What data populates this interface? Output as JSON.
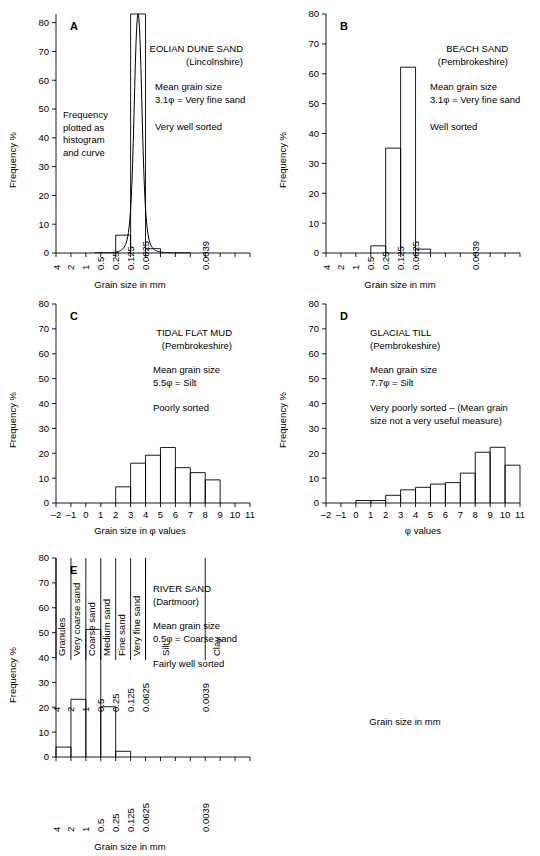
{
  "figure": {
    "axis_titles": {
      "y": "Frequency %",
      "x_mm": "Grain size in mm",
      "x_phi": "Grain size in φ values",
      "x_phi_short": "φ values"
    },
    "y_ticks": [
      0,
      10,
      20,
      30,
      40,
      50,
      60,
      70,
      80
    ],
    "mm_tick_labels": [
      "4",
      "2",
      "1",
      "0.5",
      "0.25",
      "0.125",
      "0.0625",
      "0.0039"
    ],
    "phi_tick_labels": [
      "–2",
      "–1",
      "0",
      "1",
      "2",
      "3",
      "4",
      "5",
      "6",
      "7",
      "8",
      "9",
      "10",
      "11"
    ]
  },
  "panels": [
    {
      "letter": "A",
      "title": "EOLIAN DUNE SAND",
      "locality": "(Lincolnshire)",
      "mean_label": "Mean grain size",
      "mean_value": "3.1φ = Very fine sand",
      "sorting": "Very well sorted",
      "note": "Frequency\nplotted as\nhistogram\nand curve",
      "x_axis_type": "mm"
    },
    {
      "letter": "B",
      "title": "BEACH SAND",
      "locality": "(Pembrokeshire)",
      "mean_label": "Mean grain size",
      "mean_value": "3.1φ = Very fine sand",
      "sorting": "Well sorted",
      "note": "",
      "x_axis_type": "mm"
    },
    {
      "letter": "C",
      "title": "TIDAL FLAT MUD",
      "locality": "(Pembrokeshire)",
      "mean_label": "Mean grain size",
      "mean_value": "5.5φ = Silt",
      "sorting": "Poorly sorted",
      "note": "",
      "x_axis_type": "phi"
    },
    {
      "letter": "D",
      "title": "GLACIAL TILL",
      "locality": "(Pembrokeshire)",
      "mean_label": "Mean grain size",
      "mean_value": "7.7φ = Silt",
      "sorting": "Very poorly sorted – (Mean grain",
      "sorting2": "size not a very useful measure)",
      "note": "",
      "x_axis_type": "phi"
    },
    {
      "letter": "E",
      "title": "RIVER SAND",
      "locality": "(Dartmoor)",
      "mean_label": "Mean grain size",
      "mean_value": "0.5φ = Coarse sand",
      "sorting": "Fairly well sorted",
      "note": "",
      "x_axis_type": "mm"
    }
  ],
  "classification": {
    "x_title": "Grain size in mm",
    "phi_title": "φ values",
    "classes": [
      {
        "name": "Granules",
        "phi_from": -2,
        "phi_to": -1
      },
      {
        "name": "Very coarse sand",
        "phi_from": -1,
        "phi_to": 0
      },
      {
        "name": "Coarse sand",
        "phi_from": 0,
        "phi_to": 1
      },
      {
        "name": "Medium sand",
        "phi_from": 1,
        "phi_to": 2
      },
      {
        "name": "Fine sand",
        "phi_from": 2,
        "phi_to": 3
      },
      {
        "name": "Very fine sand",
        "phi_from": 3,
        "phi_to": 4
      },
      {
        "name": "Silt",
        "phi_from": 4,
        "phi_to": 8
      },
      {
        "name": "Clay",
        "phi_from": 8,
        "phi_to": 11
      }
    ],
    "mm_labels": [
      "4",
      "2",
      "1",
      "0.5",
      "0.25",
      "0.125",
      "0.0625",
      "0.0039"
    ],
    "mm_label_phi": [
      -2,
      -1,
      0,
      1,
      2,
      3,
      4,
      8
    ]
  },
  "chart_data": [
    {
      "type": "bar",
      "panel": "A",
      "title": "EOLIAN DUNE SAND (Lincolnshire)",
      "xlabel": "Grain size in mm",
      "ylabel": "Frequency %",
      "ylim": [
        0,
        83
      ],
      "xlim_phi": [
        -2,
        11
      ],
      "grid": false,
      "bin_edges_phi": [
        2,
        3,
        4,
        5
      ],
      "values": [
        6.2,
        83,
        1.5
      ],
      "categories": [
        "0.25–0.125 mm",
        "0.125–0.0625 mm",
        "0.0625–0.0312 mm"
      ],
      "overlay_curve": true,
      "annotations": [
        "Frequency plotted as histogram and curve",
        "Mean grain size 3.1φ = Very fine sand",
        "Very well sorted"
      ]
    },
    {
      "type": "bar",
      "panel": "B",
      "title": "BEACH SAND (Pembrokeshire)",
      "xlabel": "Grain size in mm",
      "ylabel": "Frequency %",
      "ylim": [
        0,
        80
      ],
      "xlim_phi": [
        -2,
        11
      ],
      "grid": false,
      "bin_edges_phi": [
        1,
        2,
        3,
        4,
        5
      ],
      "values": [
        2.4,
        35.1,
        62.2,
        1.3
      ],
      "categories": [
        "0.5–0.25 mm",
        "0.25–0.125 mm",
        "0.125–0.0625 mm",
        "0.0625–0.0312 mm"
      ],
      "overlay_curve": false,
      "annotations": [
        "Mean grain size 3.1φ = Very fine sand",
        "Well sorted"
      ]
    },
    {
      "type": "bar",
      "panel": "C",
      "title": "TIDAL FLAT MUD (Pembrokeshire)",
      "xlabel": "Grain size in φ values",
      "ylabel": "Frequency %",
      "ylim": [
        0,
        80
      ],
      "xlim_phi": [
        -2,
        11
      ],
      "grid": false,
      "bin_edges_phi": [
        2,
        3,
        4,
        5,
        6,
        7,
        8,
        9
      ],
      "values": [
        6.5,
        16.0,
        19.2,
        22.3,
        14.2,
        12.2,
        9.3
      ],
      "categories": [
        "2–3",
        "3–4",
        "4–5",
        "5–6",
        "6–7",
        "7–8",
        "8–9"
      ],
      "overlay_curve": false,
      "annotations": [
        "Mean grain size 5.5φ = Silt",
        "Poorly sorted"
      ]
    },
    {
      "type": "bar",
      "panel": "D",
      "title": "GLACIAL TILL (Pembrokeshire)",
      "xlabel": "φ values",
      "ylabel": "Frequency %",
      "ylim": [
        0,
        80
      ],
      "xlim_phi": [
        -2,
        11
      ],
      "grid": false,
      "bin_edges_phi": [
        0,
        1,
        2,
        3,
        4,
        5,
        6,
        7,
        8,
        9,
        10,
        11
      ],
      "values": [
        1.0,
        1.0,
        3.1,
        5.3,
        6.3,
        7.6,
        8.2,
        12.0,
        20.4,
        22.4,
        15.2
      ],
      "categories": [
        "0–1",
        "1–2",
        "2–3",
        "3–4",
        "4–5",
        "5–6",
        "6–7",
        "7–8",
        "8–9",
        "9–10",
        "10–11"
      ],
      "overlay_curve": false,
      "annotations": [
        "Mean grain size 7.7φ = Silt",
        "Very poorly sorted – (Mean grain size not a very useful measure)"
      ]
    },
    {
      "type": "bar",
      "panel": "E",
      "title": "RIVER SAND (Dartmoor)",
      "xlabel": "Grain size in mm",
      "ylabel": "Frequency %",
      "ylim": [
        0,
        80
      ],
      "xlim_phi": [
        -2,
        11
      ],
      "grid": false,
      "bin_edges_phi": [
        -2,
        -1,
        0,
        1,
        2,
        3
      ],
      "values": [
        4.0,
        23.2,
        51.3,
        20.2,
        2.3
      ],
      "categories": [
        "> 4 mm",
        "4–2 mm",
        "2–1 mm",
        "1–0.5 mm",
        "0.5–0.25 mm"
      ],
      "overlay_curve": false,
      "annotations": [
        "Mean grain size 0.5φ = Coarse sand",
        "Fairly well sorted"
      ]
    }
  ]
}
